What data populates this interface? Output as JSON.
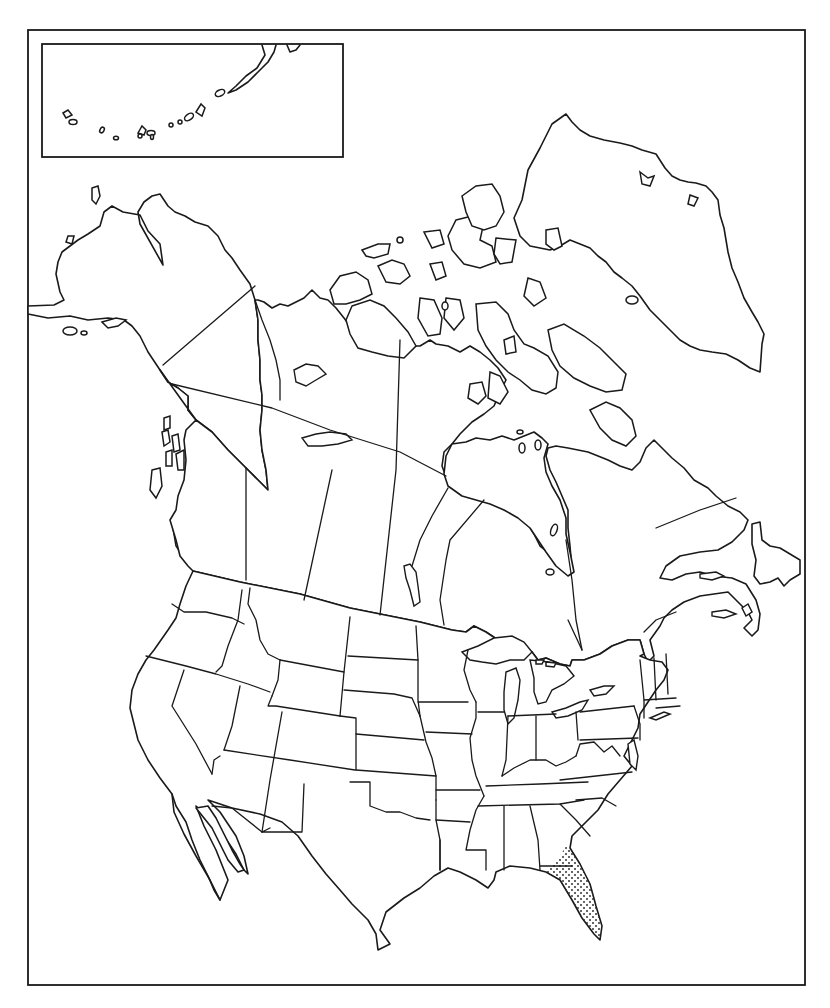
{
  "map": {
    "title": "",
    "type": "blank outline map",
    "region": "North America",
    "colors": {
      "ink": "#1a1a1a",
      "background": "#ffffff",
      "stipple": "#333333"
    },
    "frame": {
      "x": 28,
      "y": 30,
      "width": 777,
      "height": 955
    },
    "inset": {
      "label": "",
      "depicts": "Aleutian Islands",
      "x": 42,
      "y": 44,
      "width": 301,
      "height": 113
    },
    "highlighted_region": {
      "depicts": "Florida peninsula",
      "pattern": "stipple-dots"
    },
    "countries_depicted": [
      "Canada",
      "United States",
      "Mexico",
      "Greenland"
    ],
    "text_labels": []
  }
}
